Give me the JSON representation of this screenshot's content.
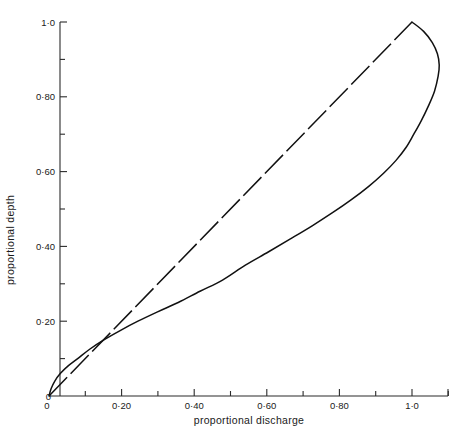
{
  "chart_data": {
    "type": "line",
    "title": "",
    "subtitle": "",
    "xlabel": "proportional  discharge",
    "ylabel": "proportional  depth",
    "xlim": [
      0,
      1.12
    ],
    "ylim": [
      0,
      1.04
    ],
    "grid": false,
    "legend": "none",
    "x_tick_labels": [
      "0",
      "0·20",
      "0·40",
      "0·60",
      "0·80",
      "1·0"
    ],
    "x_tick_values": [
      0,
      0.2,
      0.4,
      0.6,
      0.8,
      1.0
    ],
    "x_minor_tick_values": [
      0.1,
      0.3,
      0.5,
      0.7,
      0.9,
      1.1
    ],
    "y_tick_labels": [
      "0",
      "0·20",
      "0·40",
      "0·60",
      "0·80",
      "1·0"
    ],
    "y_tick_values": [
      0,
      0.2,
      0.4,
      0.6,
      0.8,
      1.0
    ],
    "y_minor_tick_values": [
      0.1,
      0.3,
      0.5,
      0.7,
      0.9
    ],
    "series": [
      {
        "name": "circular-section curve",
        "style": "solid",
        "x": [
          0.0,
          0.006,
          0.016,
          0.031,
          0.052,
          0.079,
          0.112,
          0.151,
          0.196,
          0.245,
          0.299,
          0.356,
          0.416,
          0.478,
          0.541,
          0.604,
          0.665,
          0.725,
          0.781,
          0.833,
          0.88,
          0.921,
          0.956,
          0.984,
          1.005,
          1.025,
          1.045,
          1.062,
          1.072,
          1.075,
          1.07,
          1.056,
          1.032,
          1.0
        ],
        "y": [
          0.0,
          0.02,
          0.04,
          0.06,
          0.08,
          0.1,
          0.125,
          0.15,
          0.175,
          0.2,
          0.225,
          0.25,
          0.28,
          0.31,
          0.35,
          0.385,
          0.42,
          0.455,
          0.49,
          0.525,
          0.56,
          0.595,
          0.63,
          0.665,
          0.7,
          0.735,
          0.775,
          0.815,
          0.855,
          0.885,
          0.915,
          0.945,
          0.975,
          1.0
        ]
      },
      {
        "name": "reference line",
        "style": "dashed",
        "x": [
          0.0,
          1.0
        ],
        "y": [
          0.0,
          1.0
        ]
      }
    ],
    "annotations": [
      {
        "text": "curves intersect near proportional depth 0·50",
        "x": 0.5,
        "y": 0.5
      }
    ]
  },
  "axes": {
    "x_axis_name": "proportional  discharge",
    "y_axis_name": "proportional  depth"
  }
}
